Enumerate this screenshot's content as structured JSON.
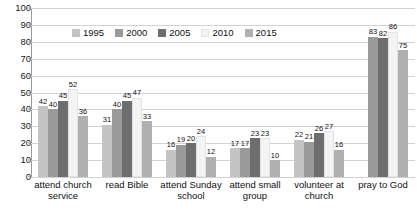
{
  "chart_data": {
    "type": "bar",
    "title": "",
    "subtitle": "",
    "xlabel": "",
    "ylabel": "",
    "ylim": [
      0,
      100
    ],
    "yticks": [
      0,
      10,
      20,
      30,
      40,
      50,
      60,
      70,
      80,
      90,
      100
    ],
    "grid": true,
    "legend_position": "top-center",
    "categories": [
      "attend church service",
      "read Bible",
      "attend Sunday school",
      "attend small group",
      "volunteer at church",
      "pray to God"
    ],
    "series": [
      {
        "name": "1995",
        "color": "#c4c4c4",
        "values": [
          42,
          31,
          16,
          17,
          22,
          null
        ]
      },
      {
        "name": "2000",
        "color": "#9a9a9a",
        "values": [
          40,
          40,
          19,
          17,
          21,
          83
        ]
      },
      {
        "name": "2005",
        "color": "#6e6e6e",
        "values": [
          45,
          45,
          20,
          23,
          26,
          82
        ]
      },
      {
        "name": "2010",
        "color": "#f4f4f4",
        "values": [
          52,
          47,
          24,
          23,
          27,
          86
        ]
      },
      {
        "name": "2015",
        "color": "#b0b0b0",
        "values": [
          36,
          33,
          12,
          10,
          16,
          75
        ]
      }
    ]
  }
}
